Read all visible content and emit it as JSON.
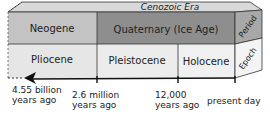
{
  "era": {
    "label": "Cenozoic Era"
  },
  "periods": [
    {
      "label": "Neogene",
      "color": "#c3c3c3"
    },
    {
      "label": "Quaternary (Ice Age)",
      "color": "#8e8e8e"
    }
  ],
  "epochs": [
    {
      "label": "Pliocene",
      "color": "#e6e6e6"
    },
    {
      "label": "Pleistocene",
      "color": "#ececec"
    },
    {
      "label": "Holocene",
      "color": "#f0f0f0"
    }
  ],
  "side_labels": {
    "period": "Period",
    "epoch": "Epoch"
  },
  "timeline": {
    "ticks": [
      {
        "line1": "4.55 billion",
        "line2": "years ago"
      },
      {
        "line1": "2.6 million",
        "line2": "years ago"
      },
      {
        "line1": "12,000",
        "line2": "years ago"
      },
      {
        "line1": "present day",
        "line2": ""
      }
    ]
  },
  "colors": {
    "top_face": "#d9d9d9",
    "side_face_period": "#a8a8a8",
    "side_face_epoch": "#f4f4f4",
    "outline": "#333333",
    "arrow": "#111111"
  }
}
